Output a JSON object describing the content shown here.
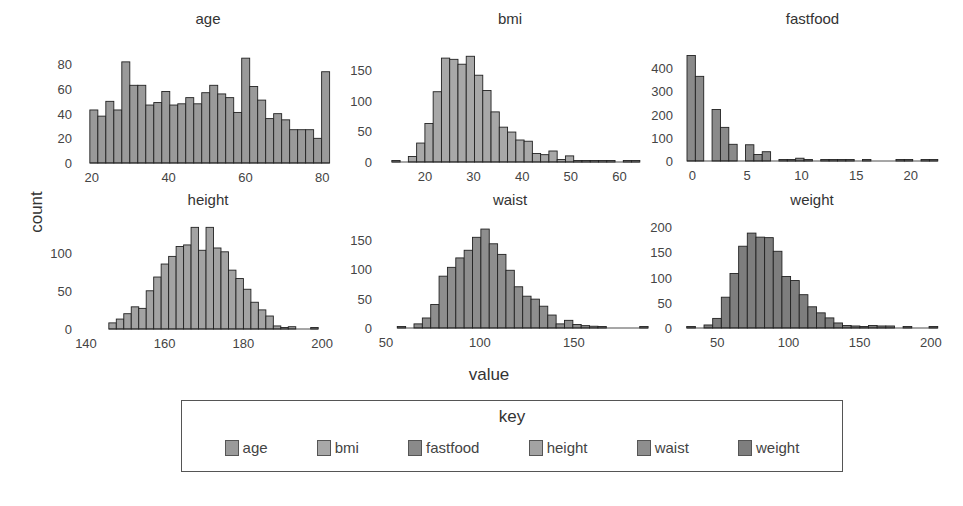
{
  "chart_data": {
    "type": "bar",
    "subtype": "faceted-histogram",
    "xlabel": "value",
    "ylabel": "count",
    "legend": {
      "title": "key",
      "position": "bottom",
      "entries": [
        "age",
        "bmi",
        "fastfood",
        "height",
        "waist",
        "weight"
      ]
    },
    "panels": [
      {
        "name": "age",
        "color": "#9a9a9a",
        "xlim": [
          18.5,
          82
        ],
        "ylim": [
          0,
          90
        ],
        "xticks": [
          20,
          40,
          60,
          80
        ],
        "yticks": [
          0,
          20,
          40,
          60,
          80
        ],
        "bin_start": 19.5,
        "bin_width": 2.08,
        "values": [
          43,
          38,
          50,
          43,
          82,
          63,
          63,
          47,
          49,
          58,
          47,
          48,
          53,
          48,
          57,
          63,
          56,
          53,
          41,
          85,
          62,
          51,
          36,
          40,
          35,
          27,
          27,
          27,
          20,
          74
        ]
      },
      {
        "name": "bmi",
        "color": "#a8a8a8",
        "xlim": [
          12,
          63
        ],
        "ylim": [
          0,
          180
        ],
        "xticks": [
          20,
          30,
          40,
          50,
          60
        ],
        "yticks": [
          0,
          50,
          100,
          150
        ],
        "bin_start": 13.2,
        "bin_width": 1.7,
        "values": [
          1,
          0,
          9,
          31,
          63,
          115,
          170,
          168,
          160,
          173,
          142,
          117,
          82,
          57,
          49,
          36,
          34,
          14,
          12,
          18,
          4,
          10,
          1,
          2,
          1,
          2,
          1,
          0,
          1,
          1
        ]
      },
      {
        "name": "fastfood",
        "color": "#8a8a8a",
        "xlim": [
          -0.5,
          22.5
        ],
        "ylim": [
          0,
          470
        ],
        "xticks": [
          0,
          5,
          10,
          15,
          20
        ],
        "yticks": [
          0,
          100,
          200,
          300,
          400
        ],
        "bin_start": -0.5,
        "bin_width": 0.766,
        "values": [
          455,
          365,
          0,
          222,
          145,
          72,
          0,
          70,
          28,
          40,
          0,
          5,
          5,
          12,
          3,
          0,
          3,
          3,
          3,
          3,
          0,
          4,
          0,
          0,
          0,
          3,
          3,
          0,
          1,
          6
        ]
      },
      {
        "name": "height",
        "color": "#a3a3a3",
        "xlim": [
          140,
          202
        ],
        "ylim": [
          0,
          140
        ],
        "xticks": [
          140,
          160,
          180,
          200
        ],
        "yticks": [
          0,
          50,
          100
        ],
        "bin_start": 145.8,
        "bin_width": 1.9,
        "values": [
          8,
          13,
          20,
          29,
          27,
          50,
          68,
          85,
          95,
          108,
          110,
          133,
          103,
          133,
          106,
          101,
          77,
          66,
          52,
          35,
          25,
          17,
          4,
          2,
          3,
          0,
          0,
          2
        ]
      },
      {
        "name": "waist",
        "color": "#8e8e8e",
        "xlim": [
          50,
          182
        ],
        "ylim": [
          0,
          180
        ],
        "xticks": [
          50,
          100,
          150
        ],
        "yticks": [
          0,
          50,
          100,
          150
        ],
        "bin_start": 56,
        "bin_width": 4.45,
        "values": [
          2,
          0,
          7,
          17,
          40,
          88,
          103,
          119,
          132,
          154,
          168,
          143,
          125,
          98,
          70,
          54,
          49,
          37,
          22,
          7,
          13,
          6,
          4,
          3,
          2,
          0,
          0,
          0,
          0,
          2
        ]
      },
      {
        "name": "weight",
        "color": "#7e7e7e",
        "xlim": [
          28,
          205
        ],
        "ylim": [
          0,
          210
        ],
        "xticks": [
          50,
          100,
          150,
          200
        ],
        "yticks": [
          0,
          50,
          100,
          150,
          200
        ],
        "bin_start": 28.5,
        "bin_width": 6.08,
        "values": [
          2,
          0,
          6,
          19,
          61,
          108,
          162,
          188,
          180,
          179,
          152,
          102,
          94,
          66,
          42,
          30,
          20,
          10,
          5,
          4,
          3,
          5,
          4,
          4,
          0,
          3,
          0,
          0,
          3
        ]
      }
    ]
  },
  "legend": {
    "title": "key",
    "items": [
      {
        "label": "age",
        "color": "#9a9a9a"
      },
      {
        "label": "bmi",
        "color": "#a8a8a8"
      },
      {
        "label": "fastfood",
        "color": "#8a8a8a"
      },
      {
        "label": "height",
        "color": "#a3a3a3"
      },
      {
        "label": "waist",
        "color": "#8e8e8e"
      },
      {
        "label": "weight",
        "color": "#7e7e7e"
      }
    ]
  },
  "axes": {
    "xlabel": "value",
    "ylabel": "count"
  }
}
